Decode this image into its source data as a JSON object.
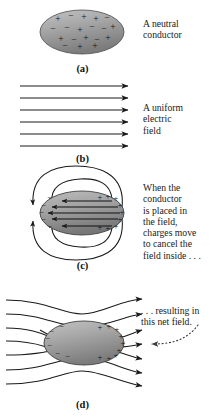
{
  "figure": {
    "background": "#ffffff",
    "conductor_fill_light": "#b4b4b4",
    "conductor_fill_dark": "#7e7e7e",
    "line_color": "#1a1a1a"
  },
  "panels": [
    {
      "id": "a",
      "caption": "(a)",
      "note": "A neutral\nconductor",
      "charges": [
        {
          "sign": "+",
          "x": 58,
          "y": 19
        },
        {
          "sign": "−",
          "x": 72,
          "y": 16
        },
        {
          "sign": "+",
          "x": 84,
          "y": 17
        },
        {
          "sign": "+",
          "x": 96,
          "y": 19
        },
        {
          "sign": "−",
          "x": 106,
          "y": 18
        },
        {
          "sign": "+",
          "x": 52,
          "y": 29
        },
        {
          "sign": "−",
          "x": 67,
          "y": 28
        },
        {
          "sign": "+",
          "x": 80,
          "y": 30
        },
        {
          "sign": "−",
          "x": 92,
          "y": 27
        },
        {
          "sign": "+",
          "x": 104,
          "y": 29
        },
        {
          "sign": "−",
          "x": 112,
          "y": 27
        },
        {
          "sign": "+",
          "x": 60,
          "y": 39
        },
        {
          "sign": "−",
          "x": 74,
          "y": 40
        },
        {
          "sign": "+",
          "x": 86,
          "y": 38
        },
        {
          "sign": "−",
          "x": 97,
          "y": 40
        },
        {
          "sign": "+",
          "x": 108,
          "y": 38
        },
        {
          "sign": "−",
          "x": 64,
          "y": 46
        },
        {
          "sign": "+",
          "x": 79,
          "y": 47
        },
        {
          "sign": "+",
          "x": 95,
          "y": 46
        }
      ]
    },
    {
      "id": "b",
      "caption": "(b)",
      "note": "A uniform\nelectric\nfield",
      "field_line_count": 6,
      "field_direction": "right"
    },
    {
      "id": "c",
      "caption": "(c)",
      "note": "When the\nconductor\nis placed in\nthe field,\ncharges move\nto cancel the\nfield inside . . .",
      "interior_line_count": 5,
      "interior_direction": "left",
      "negative_side": "left",
      "positive_side": "right",
      "loop_count": 4
    },
    {
      "id": "d",
      "caption": "(d)",
      "note": ". . . resulting in\nthis net field.",
      "field_line_count": 6,
      "negative_side": "left",
      "positive_side": "right",
      "pointer": "dotted-curved-arrow"
    }
  ]
}
